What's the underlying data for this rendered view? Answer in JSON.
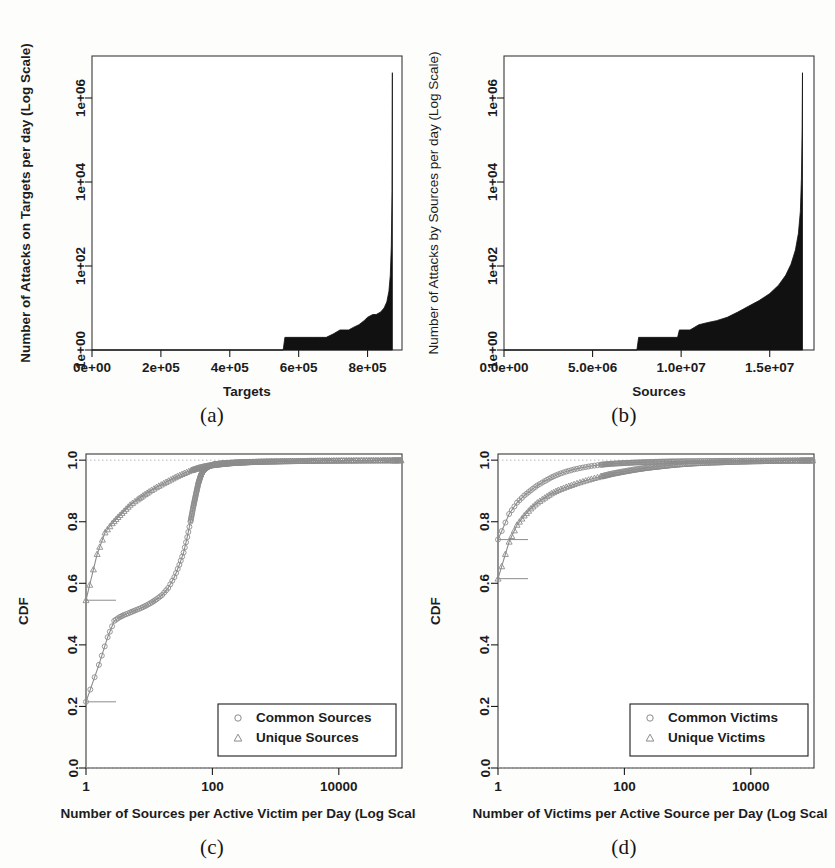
{
  "figure": {
    "background": "#fdfdfc",
    "ink": "#1c1c1c",
    "fill_color": "#111111",
    "marker_color": "#8c8c8c"
  },
  "panels": {
    "a": {
      "caption": "(a)",
      "xlabel": "Targets",
      "ylabel": "Number of Attacks on Targets per day (Log Scale)",
      "xticks": [
        "0e+00",
        "2e+05",
        "4e+05",
        "6e+05",
        "8e+05"
      ],
      "yticks": [
        "1e+00",
        "1e+02",
        "1e+04",
        "1e+06"
      ]
    },
    "b": {
      "caption": "(b)",
      "xlabel": "Sources",
      "ylabel": "Number of Attacks by Sources per day (Log Scale)",
      "xticks": [
        "0.0e+00",
        "5.0e+06",
        "1.0e+07",
        "1.5e+07"
      ],
      "yticks": [
        "1e+00",
        "1e+02",
        "1e+04",
        "1e+06"
      ]
    },
    "c": {
      "caption": "(c)",
      "xlabel": "Number of Sources per Active Victim per Day (Log Scale)",
      "ylabel": "CDF",
      "xticks": [
        "1",
        "100",
        "10000"
      ],
      "yticks": [
        "0.0",
        "0.2",
        "0.4",
        "0.6",
        "0.8",
        "1.0"
      ],
      "legend": [
        {
          "marker": "circle-marker",
          "label": "Common Sources"
        },
        {
          "marker": "triangle-marker",
          "label": "Unique Sources"
        }
      ]
    },
    "d": {
      "caption": "(d)",
      "xlabel": "Number of Victims per Active Source per Day (Log Scale)",
      "ylabel": "CDF",
      "xticks": [
        "1",
        "100",
        "10000"
      ],
      "yticks": [
        "0.0",
        "0.2",
        "0.4",
        "0.6",
        "0.8",
        "1.0"
      ],
      "legend": [
        {
          "marker": "circle-marker",
          "label": "Common Victims"
        },
        {
          "marker": "triangle-marker",
          "label": "Unique Victims"
        }
      ]
    }
  },
  "chart_data": [
    {
      "id": "a",
      "type": "area",
      "title": "",
      "xlabel": "Targets",
      "ylabel": "Number of Attacks on Targets per day (Log Scale)",
      "xlim": [
        0,
        900000
      ],
      "ylim": [
        1,
        10000000
      ],
      "yscale": "log",
      "xticks": [
        0,
        200000,
        400000,
        600000,
        800000
      ],
      "xticklabels": [
        "0e+00",
        "2e+05",
        "4e+05",
        "6e+05",
        "8e+05"
      ],
      "yticks": [
        1,
        100,
        10000,
        1000000
      ],
      "yticklabels": [
        "1e+00",
        "1e+02",
        "1e+04",
        "1e+06"
      ],
      "grid": false,
      "legend": null,
      "x": [
        0,
        60000,
        150000,
        300000,
        450000,
        555000,
        560000,
        600000,
        640000,
        680000,
        700000,
        720000,
        745000,
        760000,
        775000,
        790000,
        800000,
        815000,
        825000,
        838000,
        848000,
        856000,
        862000,
        866000,
        869000,
        871000,
        872000
      ],
      "values": [
        1,
        1,
        1,
        1,
        1,
        1,
        2,
        2,
        2,
        2,
        2.4,
        3,
        3,
        3.5,
        4,
        5,
        6,
        7,
        7,
        8,
        10,
        14,
        25,
        60,
        300,
        6000,
        4000000
      ]
    },
    {
      "id": "b",
      "type": "area",
      "title": "",
      "xlabel": "Sources",
      "ylabel": "Number of Attacks by Sources per day (Log Scale)",
      "xlim": [
        0,
        17500000
      ],
      "ylim": [
        1,
        10000000
      ],
      "yscale": "log",
      "xticks": [
        0,
        5000000,
        10000000,
        15000000
      ],
      "xticklabels": [
        "0.0e+00",
        "5.0e+06",
        "1.0e+07",
        "1.5e+07"
      ],
      "yticks": [
        1,
        100,
        10000,
        1000000
      ],
      "yticklabels": [
        "1e+00",
        "1e+02",
        "1e+04",
        "1e+06"
      ],
      "grid": false,
      "legend": null,
      "x": [
        0,
        1000000,
        3000000,
        5000000,
        6500000,
        7500000,
        7600000,
        8500000,
        9200000,
        9800000,
        9900000,
        10500000,
        11000000,
        11500000,
        12000000,
        12600000,
        13200000,
        13800000,
        14400000,
        15000000,
        15500000,
        15900000,
        16200000,
        16450000,
        16620000,
        16730000,
        16790000,
        16830000,
        16850000
      ],
      "values": [
        1,
        1,
        1,
        1,
        1,
        1,
        2,
        2,
        2,
        2,
        3,
        3,
        4,
        4.5,
        5,
        6,
        8,
        11,
        15,
        22,
        35,
        60,
        110,
        240,
        600,
        2000,
        12000,
        200000,
        4000000
      ]
    },
    {
      "id": "c",
      "type": "line",
      "title": "",
      "xlabel": "Number of Sources per Active Victim per Day (Log Scale)",
      "ylabel": "CDF",
      "xlim": [
        1,
        100000
      ],
      "ylim": [
        0,
        1.02
      ],
      "xscale": "log",
      "xticks": [
        1,
        100,
        10000
      ],
      "xticklabels": [
        "1",
        "100",
        "10000"
      ],
      "yticks": [
        0.0,
        0.2,
        0.4,
        0.6,
        0.8,
        1.0
      ],
      "yticklabels": [
        "0.0",
        "0.2",
        "0.4",
        "0.6",
        "0.8",
        "1.0"
      ],
      "grid": false,
      "legend_position": "lower right",
      "series": [
        {
          "name": "Common Sources",
          "marker": "circle",
          "x": [
            1,
            1.6,
            2.2,
            2.8,
            3.4,
            4,
            5,
            6,
            7.5,
            9,
            11,
            13,
            16,
            20,
            25,
            30,
            35,
            40,
            45,
            50,
            55,
            60,
            65,
            70,
            78,
            88,
            100,
            120,
            150,
            200,
            300,
            500,
            900,
            1800,
            4000,
            9000,
            20000,
            50000,
            100000
          ],
          "y": [
            0.215,
            0.335,
            0.425,
            0.478,
            0.49,
            0.497,
            0.505,
            0.512,
            0.52,
            0.528,
            0.538,
            0.548,
            0.562,
            0.585,
            0.62,
            0.66,
            0.7,
            0.75,
            0.8,
            0.85,
            0.89,
            0.925,
            0.948,
            0.963,
            0.973,
            0.98,
            0.985,
            0.988,
            0.99,
            0.992,
            0.994,
            0.995,
            0.996,
            0.997,
            0.998,
            0.9985,
            0.999,
            0.9993,
            0.9995
          ]
        },
        {
          "name": "Unique Sources",
          "marker": "triangle",
          "x": [
            1,
            1.5,
            2,
            2.6,
            3.2,
            4,
            5,
            6.5,
            8,
            10,
            13,
            17,
            22,
            28,
            36,
            46,
            60,
            80,
            110,
            150,
            220,
            350,
            600,
            1100,
            2300,
            5000,
            12000,
            30000,
            70000,
            100000
          ],
          "y": [
            0.545,
            0.695,
            0.765,
            0.795,
            0.815,
            0.835,
            0.855,
            0.872,
            0.885,
            0.898,
            0.912,
            0.925,
            0.937,
            0.948,
            0.958,
            0.967,
            0.975,
            0.981,
            0.985,
            0.988,
            0.991,
            0.993,
            0.995,
            0.996,
            0.997,
            0.998,
            0.9985,
            0.999,
            0.9993,
            0.9995
          ]
        }
      ]
    },
    {
      "id": "d",
      "type": "line",
      "title": "",
      "xlabel": "Number of Victims per Active Source per Day (Log Scale)",
      "ylabel": "CDF",
      "xlim": [
        1,
        100000
      ],
      "ylim": [
        0,
        1.02
      ],
      "xscale": "log",
      "xticks": [
        1,
        100,
        10000
      ],
      "xticklabels": [
        "1",
        "100",
        "10000"
      ],
      "yticks": [
        0.0,
        0.2,
        0.4,
        0.6,
        0.8,
        1.0
      ],
      "yticklabels": [
        "0.0",
        "0.2",
        "0.4",
        "0.6",
        "0.8",
        "1.0"
      ],
      "grid": false,
      "legend_position": "lower right",
      "series": [
        {
          "name": "Common Victims",
          "marker": "circle",
          "x": [
            1,
            1.5,
            2,
            2.6,
            3.3,
            4.2,
            5.5,
            7,
            9,
            12,
            16,
            22,
            30,
            42,
            60,
            90,
            140,
            220,
            360,
            600,
            1100,
            2200,
            4500,
            10000,
            25000,
            60000,
            100000
          ],
          "y": [
            0.742,
            0.825,
            0.862,
            0.885,
            0.902,
            0.918,
            0.932,
            0.944,
            0.954,
            0.963,
            0.97,
            0.976,
            0.981,
            0.985,
            0.988,
            0.99,
            0.992,
            0.9935,
            0.995,
            0.996,
            0.9968,
            0.9975,
            0.998,
            0.9985,
            0.999,
            0.9993,
            0.9995
          ]
        },
        {
          "name": "Unique Victims",
          "marker": "triangle",
          "x": [
            1,
            1.5,
            2,
            2.6,
            3.3,
            4.2,
            5.5,
            7,
            9,
            12,
            16,
            22,
            30,
            42,
            60,
            90,
            140,
            220,
            360,
            600,
            1100,
            2200,
            4500,
            10000,
            25000,
            60000,
            100000
          ],
          "y": [
            0.615,
            0.735,
            0.79,
            0.82,
            0.843,
            0.862,
            0.878,
            0.892,
            0.903,
            0.913,
            0.922,
            0.931,
            0.939,
            0.947,
            0.955,
            0.962,
            0.969,
            0.975,
            0.98,
            0.985,
            0.989,
            0.992,
            0.994,
            0.996,
            0.9975,
            0.9985,
            0.999
          ]
        }
      ]
    }
  ]
}
